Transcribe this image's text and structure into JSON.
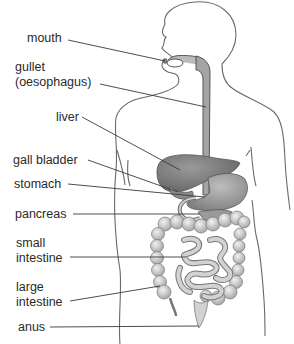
{
  "diagram": {
    "title": "",
    "colors": {
      "outline": "#6a6a6a",
      "leader_line": "#3a3a3a",
      "organ_dark": "#7a7a7a",
      "organ_mid": "#9c9c9c",
      "organ_light": "#cfcfcf",
      "intestine_fill": "#d6d6d6",
      "label_text": "#2a2a2a"
    },
    "labels": [
      {
        "id": "mouth",
        "line1": "mouth",
        "line2": ""
      },
      {
        "id": "gullet",
        "line1": "gullet",
        "line2": "(oesophagus)"
      },
      {
        "id": "liver",
        "line1": "liver",
        "line2": ""
      },
      {
        "id": "gall-bladder",
        "line1": "gall bladder",
        "line2": ""
      },
      {
        "id": "stomach",
        "line1": "stomach",
        "line2": ""
      },
      {
        "id": "pancreas",
        "line1": "pancreas",
        "line2": ""
      },
      {
        "id": "small-intestine",
        "line1": "small",
        "line2": "intestine"
      },
      {
        "id": "large-intestine",
        "line1": "large",
        "line2": "intestine"
      },
      {
        "id": "anus",
        "line1": "anus",
        "line2": ""
      }
    ]
  }
}
